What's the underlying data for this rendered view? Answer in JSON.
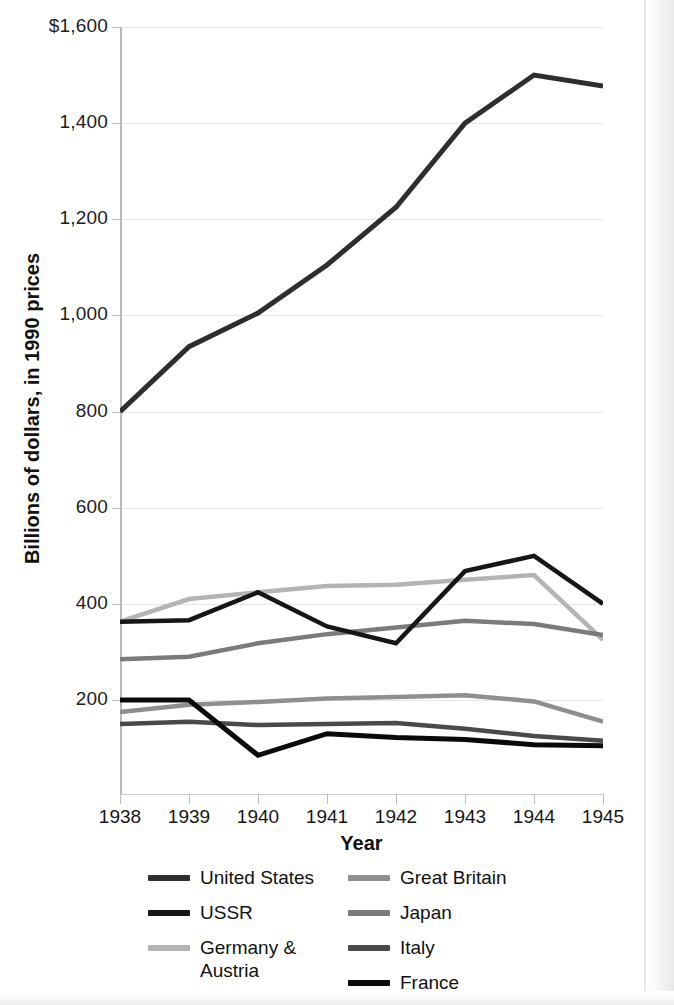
{
  "chart_data": {
    "type": "line",
    "title": "",
    "xlabel": "Year",
    "ylabel": "Billions of dollars, in 1990 prices",
    "x": [
      1938,
      1939,
      1940,
      1941,
      1942,
      1943,
      1944,
      1945
    ],
    "xtick_labels": [
      "1938",
      "1939",
      "1940",
      "1941",
      "1942",
      "1943",
      "1944",
      "1945"
    ],
    "ytick_labels": [
      "$1,600",
      "1,400",
      "1,200",
      "1,000",
      "800",
      "600",
      "400",
      "200"
    ],
    "ytick_values": [
      1600,
      1400,
      1200,
      1000,
      800,
      600,
      400,
      200
    ],
    "ylim": [
      0,
      1600
    ],
    "xlim": [
      1938,
      1945
    ],
    "grid": "horizontal",
    "legend_position": "bottom",
    "series": [
      {
        "name": "United States",
        "color": "#2e2e2e",
        "width": 5,
        "values": [
          800,
          935,
          1005,
          1105,
          1225,
          1400,
          1500,
          1477
        ]
      },
      {
        "name": "USSR",
        "color": "#161616",
        "width": 4.5,
        "values": [
          363,
          366,
          424,
          353,
          318,
          468,
          500,
          400
        ]
      },
      {
        "name": "Germany & Austria",
        "color": "#b4b4b4",
        "width": 4.5,
        "values": [
          363,
          410,
          424,
          437,
          440,
          450,
          460,
          325
        ]
      },
      {
        "name": "Great Britain",
        "color": "#8f8f8f",
        "width": 4.5,
        "values": [
          175,
          190,
          196,
          203,
          206,
          210,
          197,
          155
        ]
      },
      {
        "name": "Japan",
        "color": "#7b7b7b",
        "width": 4.5,
        "values": [
          285,
          290,
          318,
          337,
          351,
          365,
          358,
          335
        ]
      },
      {
        "name": "Italy",
        "color": "#4a4a4a",
        "width": 4.5,
        "values": [
          150,
          155,
          148,
          150,
          152,
          140,
          125,
          115
        ]
      },
      {
        "name": "France",
        "color": "#0a0a0a",
        "width": 5,
        "values": [
          200,
          200,
          85,
          130,
          122,
          118,
          107,
          105
        ]
      }
    ]
  },
  "axes": {
    "x_title": "Year",
    "y_title": "Billions of dollars, in 1990 prices"
  },
  "legend": {
    "left_column": [
      {
        "label": "United States",
        "color": "#2e2e2e"
      },
      {
        "label": "USSR",
        "color": "#161616"
      },
      {
        "label": "Germany &\nAustria",
        "color": "#b4b4b4"
      }
    ],
    "right_column": [
      {
        "label": "Great Britain",
        "color": "#8f8f8f"
      },
      {
        "label": "Japan",
        "color": "#7b7b7b"
      },
      {
        "label": "Italy",
        "color": "#4a4a4a"
      },
      {
        "label": "France",
        "color": "#0a0a0a"
      }
    ]
  }
}
